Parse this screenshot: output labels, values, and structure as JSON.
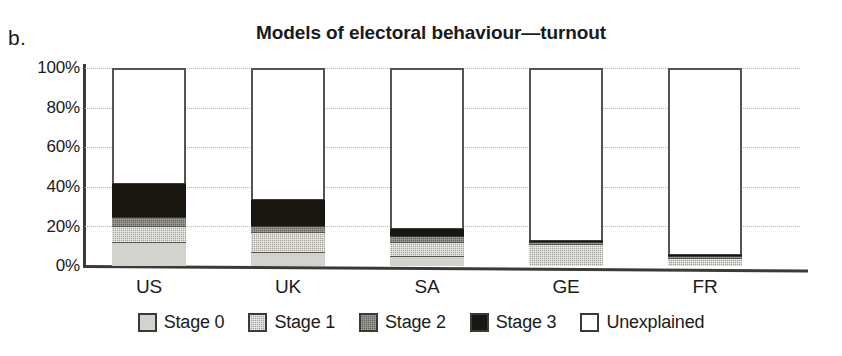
{
  "panel_label": "b.",
  "chart_data": {
    "type": "bar",
    "subtype": "stacked-bar-100",
    "title": "Models of electoral behaviour—turnout",
    "xlabel": "",
    "ylabel": "",
    "categories": [
      "US",
      "UK",
      "SA",
      "GE",
      "FR"
    ],
    "ylim": [
      0,
      100
    ],
    "yticks": [
      0,
      20,
      40,
      60,
      80,
      100
    ],
    "ytick_labels": [
      "0%",
      "20%",
      "40%",
      "60%",
      "80%",
      "100%"
    ],
    "grid": true,
    "grid_style": "dotted-horizontal",
    "legend_position": "bottom-center",
    "units": "percent",
    "series": [
      {
        "name": "Stage 0",
        "color": "#d3d2cc",
        "values": [
          12,
          7,
          5,
          0,
          0
        ]
      },
      {
        "name": "Stage 1",
        "color": "#a3a29c",
        "values": [
          8,
          10,
          7,
          11,
          4
        ]
      },
      {
        "name": "Stage 2",
        "color": "#67665f",
        "values": [
          5,
          3,
          3,
          1,
          1
        ]
      },
      {
        "name": "Stage 3",
        "color": "#1a1713",
        "values": [
          17,
          14,
          4,
          1,
          1
        ]
      },
      {
        "name": "Unexplained",
        "color": "#ffffff",
        "values": [
          58,
          66,
          81,
          87,
          94
        ]
      }
    ],
    "explained_totals": [
      42,
      34,
      19,
      13,
      6
    ]
  },
  "legend": {
    "items": [
      {
        "label": "Stage 0",
        "swatch": "stage0"
      },
      {
        "label": "Stage 1",
        "swatch": "stage1"
      },
      {
        "label": "Stage 2",
        "swatch": "stage2"
      },
      {
        "label": "Stage 3",
        "swatch": "stage3"
      },
      {
        "label": "Unexplained",
        "swatch": "unexplained"
      }
    ]
  }
}
